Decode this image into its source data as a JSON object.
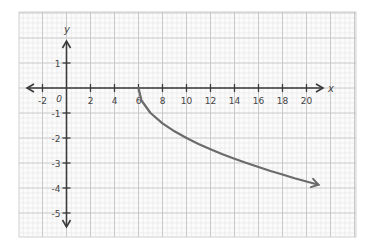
{
  "chart_data": {
    "type": "line",
    "title": "",
    "xlabel": "x",
    "ylabel": "y",
    "xlim": [
      -2.6,
      22.2
    ],
    "ylim": [
      -5.9,
      3.0
    ],
    "grid": true,
    "x_ticks": [
      -2,
      2,
      4,
      6,
      8,
      10,
      12,
      14,
      16,
      18,
      20
    ],
    "x_tick_labels": [
      "-2",
      "2",
      "4",
      "6",
      "8",
      "10",
      "12",
      "14",
      "16",
      "18",
      "20"
    ],
    "y_ticks": [
      1,
      -1,
      -2,
      -3,
      -4,
      -5
    ],
    "y_tick_labels": [
      "1",
      "-1",
      "-2",
      "-3",
      "-4",
      "-5"
    ],
    "origin_label": "0",
    "series": [
      {
        "name": "y = -sqrt(x - 6)",
        "color": "#6b6b6b",
        "start_point": [
          6,
          0
        ],
        "end_arrow": true,
        "x": [
          6,
          6.25,
          7,
          8,
          9,
          10,
          11,
          12,
          13,
          14,
          15,
          16,
          17,
          18,
          19,
          20,
          21
        ],
        "values": [
          0,
          -0.5,
          -1,
          -1.41,
          -1.73,
          -2,
          -2.24,
          -2.45,
          -2.65,
          -2.83,
          -3,
          -3.16,
          -3.32,
          -3.46,
          -3.61,
          -3.74,
          -3.87
        ]
      }
    ]
  },
  "colors": {
    "axis": "#3a3a3a",
    "curve": "#6b6b6b",
    "grid_major": "#c8c8c8",
    "grid_minor": "#e6e6e6",
    "background": "#ffffff"
  }
}
